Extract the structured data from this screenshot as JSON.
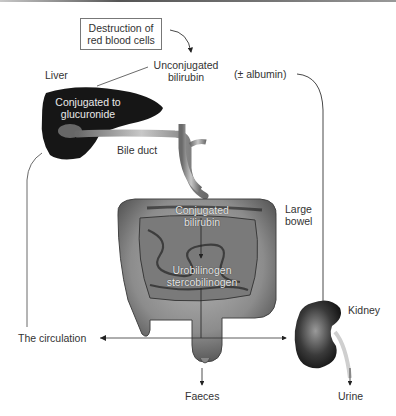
{
  "diagram": {
    "title_box": "Destruction of red blood cells",
    "title_box_lines": [
      "Destruction of",
      "red blood cells"
    ],
    "labels": {
      "liver": "Liver",
      "unconjugated_1": "Unconjugated",
      "unconjugated_2": "bilirubin",
      "albumin": "(± albumin)",
      "conj_glucuronide_1": "Conjugated to",
      "conj_glucuronide_2": "glucuronide",
      "bile_duct": "Bile duct",
      "conj_bilirubin_1": "Conjugated",
      "conj_bilirubin_2": "bilirubin",
      "large_bowel_1": "Large",
      "large_bowel_2": "bowel",
      "urobilinogen_1": "Urobilinogen",
      "urobilinogen_2": "stercobilinogen",
      "kidney": "Kidney",
      "circulation": "The circulation",
      "faeces": "Faeces",
      "urine": "Urine"
    },
    "colors": {
      "organ_dark": "#1a1a1a",
      "bowel_mid": "#8a8a8a",
      "line": "#333333"
    }
  }
}
